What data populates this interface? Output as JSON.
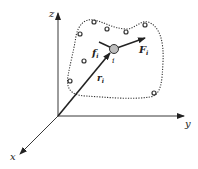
{
  "diagram": {
    "title": "",
    "axes": {
      "z_label": "z",
      "y_label": "y",
      "x_label": "x"
    },
    "particle": {
      "label": "i",
      "position_vector_label": "r",
      "position_vector_subscript": "i",
      "external_force_label": "F",
      "external_force_subscript": "i",
      "internal_force_label": "f",
      "internal_force_subscript": "i"
    },
    "region": {
      "description": "dotted boundary enclosing system of particles",
      "particle_count": 8
    },
    "colors": {
      "line": "#222222",
      "particle_fill": "#bdbdbd",
      "background": "#ffffff"
    }
  }
}
